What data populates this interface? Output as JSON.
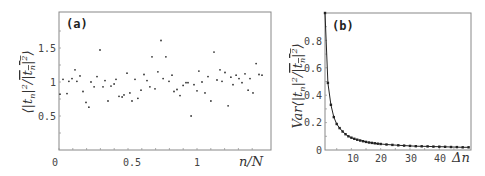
{
  "chart_data": [
    {
      "panel": "(a)",
      "type": "scatter",
      "xlabel": "n/N",
      "ylabel": "⟨|t_n|² / overline(|t_n|²)⟩",
      "xlim": [
        0,
        1.53
      ],
      "ylim": [
        0,
        2.0
      ],
      "xticks": [
        "0",
        "0.5",
        "1"
      ],
      "yticks": [
        "0.5",
        "1",
        "1.5"
      ],
      "grid": false,
      "x": [
        0.007,
        0.029,
        0.058,
        0.072,
        0.094,
        0.116,
        0.13,
        0.152,
        0.174,
        0.196,
        0.217,
        0.232,
        0.254,
        0.275,
        0.297,
        0.319,
        0.333,
        0.355,
        0.377,
        0.399,
        0.413,
        0.435,
        0.457,
        0.471,
        0.493,
        0.514,
        0.529,
        0.551,
        0.572,
        0.594,
        0.616,
        0.638,
        0.659,
        0.674,
        0.696,
        0.717,
        0.739,
        0.754,
        0.775,
        0.797,
        0.819,
        0.833,
        0.855,
        0.877,
        0.899,
        0.92,
        0.935,
        0.957,
        0.978,
        1.0,
        1.014,
        1.036,
        1.058,
        1.08,
        1.101,
        1.123,
        1.145,
        1.167,
        1.181,
        1.203,
        1.225,
        1.246,
        1.261,
        1.283,
        1.304,
        1.326,
        1.348,
        1.37,
        1.384,
        1.406,
        1.428,
        1.449,
        1.471
      ],
      "y": [
        0.82,
        1.04,
        0.83,
        1.01,
        1.05,
        1.18,
        1.01,
        1.09,
        0.86,
        0.7,
        0.63,
        1.0,
        0.93,
        1.08,
        1.47,
        0.93,
        1.02,
        0.72,
        0.94,
        0.97,
        1.04,
        0.79,
        0.78,
        0.81,
        1.13,
        0.84,
        0.72,
        1.04,
        0.76,
        0.88,
        1.11,
        1.02,
        0.93,
        1.37,
        0.9,
        1.15,
        1.61,
        1.05,
        1.37,
        1.01,
        1.1,
        0.86,
        0.89,
        0.8,
        0.95,
        0.99,
        0.99,
        0.5,
        0.96,
        0.87,
        1.16,
        1.0,
        0.84,
        1.08,
        0.72,
        1.44,
        1.03,
        1.18,
        1.01,
        1.14,
        0.65,
        1.07,
        0.96,
        1.1,
        1.05,
        0.99,
        1.12,
        0.88,
        1.05,
        0.84,
        1.27,
        1.11,
        1.1
      ]
    },
    {
      "panel": "(b)",
      "type": "line",
      "xlabel": "Δn",
      "ylabel": "Var⟨|t_n|² / overline(|t_n|²)⟩",
      "xlim": [
        1,
        50
      ],
      "ylim": [
        0,
        1.0
      ],
      "xticks": [
        "10",
        "20",
        "30",
        "40"
      ],
      "yticks": [
        "0",
        "0.2",
        "0.4",
        "0.6",
        "0.8"
      ],
      "grid": false,
      "markers": true,
      "x": [
        1,
        2,
        3,
        4,
        5,
        6,
        7,
        8,
        9,
        10,
        11,
        12,
        13,
        14,
        15,
        16,
        17,
        18,
        19,
        20,
        22,
        24,
        26,
        28,
        30,
        32,
        34,
        36,
        38,
        40,
        42,
        44,
        46,
        48,
        50
      ],
      "y": [
        1.0,
        0.49,
        0.33,
        0.24,
        0.19,
        0.16,
        0.135,
        0.115,
        0.1,
        0.09,
        0.082,
        0.075,
        0.069,
        0.064,
        0.059,
        0.055,
        0.052,
        0.049,
        0.046,
        0.044,
        0.04,
        0.037,
        0.034,
        0.032,
        0.03,
        0.028,
        0.027,
        0.026,
        0.025,
        0.024,
        0.023,
        0.022,
        0.021,
        0.02,
        0.02
      ]
    }
  ],
  "panels": {
    "a": {
      "label": "(a)",
      "xlabel": "n/N",
      "xticks": [
        "0",
        "0.5",
        "1"
      ],
      "yticks": [
        "0.5",
        "1",
        "1.5"
      ]
    },
    "b": {
      "label": "(b)",
      "xlabel": "Δn",
      "xticks": [
        "10",
        "20",
        "30",
        "40"
      ],
      "yticks": [
        "0",
        "0.2",
        "0.4",
        "0.6",
        "0.8"
      ],
      "ylabel_prefix": "Var"
    }
  }
}
